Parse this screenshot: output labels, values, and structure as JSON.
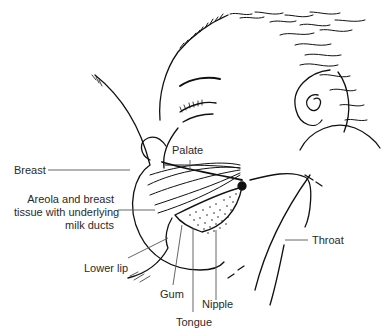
{
  "figure": {
    "labels": {
      "breast": "Breast",
      "palate": "Palate",
      "areola_line1": "Areola and breast",
      "areola_line2": "tissue with underlying",
      "areola_line3": "milk ducts",
      "throat": "Throat",
      "lower_lip": "Lower lip",
      "gum": "Gum",
      "nipple": "Nipple",
      "tongue": "Tongue"
    },
    "colors": {
      "line": "#111111",
      "label_text": "#2a2a2a",
      "leader": "#555555",
      "background": "#ffffff"
    }
  }
}
